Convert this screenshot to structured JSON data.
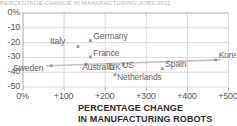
{
  "figure": {
    "title_fragment": "PERCENTAGE CHANGE IN MANUFACTURING JOBS 2011",
    "caption_line1": "PERCENTAGE CHANGE",
    "caption_line2": "IN MANUFACTURING ROBOTS",
    "colors": {
      "background": "#ffffff",
      "grid": "#d9d9d9",
      "axis": "#a8a8a8",
      "marker": "#9a9a9a",
      "trendline": "#c2c2c2",
      "label_text": "#636363",
      "tick_text": "#5a5a5a",
      "caption_text": "#2b2b2b"
    }
  },
  "chart_data": {
    "type": "scatter",
    "title": "",
    "xlabel": "PERCENTAGE CHANGE IN MANUFACTURING ROBOTS",
    "ylabel": "",
    "xlim": [
      0,
      500
    ],
    "ylim": [
      -50,
      0
    ],
    "grid": true,
    "legend": "none",
    "xticks": [
      0,
      100,
      200,
      300,
      400,
      500
    ],
    "yticks": [
      0,
      -10,
      -20,
      -30,
      -40,
      -50
    ],
    "xtick_labels": [
      "0%",
      "+100",
      "+200",
      "+300",
      "+400",
      "+500"
    ],
    "ytick_labels": [
      "0%",
      "-10",
      "-20",
      "-30",
      "-40",
      "-50"
    ],
    "points": [
      {
        "name": "Sweden",
        "x": 70,
        "y": -36,
        "label_dx": -38,
        "label_dy": 5
      },
      {
        "name": "Italy",
        "x": 135,
        "y": -23,
        "label_dx": -28,
        "label_dy": -3
      },
      {
        "name": "Australia",
        "x": 155,
        "y": -35,
        "label_dx": -4,
        "label_dy": 6
      },
      {
        "name": "Germany",
        "x": 165,
        "y": -19,
        "label_dx": 3,
        "label_dy": -2
      },
      {
        "name": "France",
        "x": 165,
        "y": -30,
        "label_dx": 3,
        "label_dy": -1
      },
      {
        "name": "UK",
        "x": 215,
        "y": -35,
        "label_dx": -2,
        "label_dy": 6
      },
      {
        "name": "US",
        "x": 245,
        "y": -35,
        "label_dx": -1,
        "label_dy": 4
      },
      {
        "name": "Netherlands",
        "x": 225,
        "y": -42,
        "label_dx": 2,
        "label_dy": 5
      },
      {
        "name": "Spain",
        "x": 340,
        "y": -38,
        "label_dx": 3,
        "label_dy": -2
      },
      {
        "name": "Korea",
        "x": 470,
        "y": -32,
        "label_dx": 3,
        "label_dy": -2
      }
    ],
    "trendline": {
      "name": "fit-line",
      "x_start": 60,
      "y_start": -36,
      "x_end": 480,
      "y_end": -32
    }
  }
}
